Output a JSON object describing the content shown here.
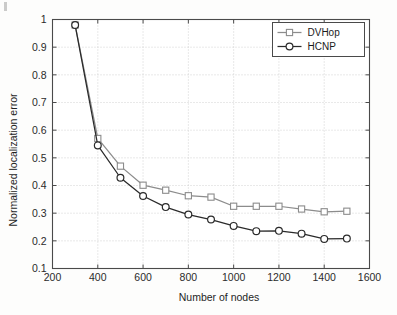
{
  "figure": {
    "background_color": "#fdfdfc",
    "plot_background_color": "#ffffff",
    "axis_color": "#4a4a4a",
    "grid_color": "#c8c8c8"
  },
  "chart_data": {
    "type": "line",
    "title": "",
    "subtitle": "",
    "xlabel": "Number of nodes",
    "ylabel": "Normalized localization error",
    "x": [
      300,
      400,
      500,
      600,
      700,
      800,
      900,
      1000,
      1100,
      1200,
      1300,
      1400,
      1500
    ],
    "xlim": [
      200,
      1600
    ],
    "ylim": [
      0.1,
      1.0
    ],
    "xticks": [
      200,
      400,
      600,
      800,
      1000,
      1200,
      1400,
      1600
    ],
    "yticks": [
      0.1,
      0.2,
      0.3,
      0.4,
      0.5,
      0.6,
      0.7,
      0.8,
      0.9,
      1
    ],
    "xtick_labels": [
      "200",
      "400",
      "600",
      "800",
      "1000",
      "1200",
      "1400",
      "1600"
    ],
    "ytick_labels": [
      "0.1",
      "0.2",
      "0.3",
      "0.4",
      "0.5",
      "0.6",
      "0.7",
      "0.8",
      "0.9",
      "1"
    ],
    "grid": true,
    "grid_style": "dotted",
    "legend_position": "top-right",
    "series": [
      {
        "name": "DVHop",
        "color": "#8c8c8c",
        "marker": "square",
        "marker_face": "#ffffff",
        "values": [
          0.98,
          0.57,
          0.47,
          0.401,
          0.383,
          0.363,
          0.358,
          0.325,
          0.325,
          0.325,
          0.315,
          0.305,
          0.307
        ]
      },
      {
        "name": "HCNP",
        "color": "#2a2a2a",
        "marker": "circle",
        "marker_face": "#ffffff",
        "values": [
          0.98,
          0.545,
          0.428,
          0.362,
          0.322,
          0.295,
          0.277,
          0.254,
          0.235,
          0.236,
          0.226,
          0.207,
          0.208
        ]
      }
    ]
  },
  "legend": {
    "items": [
      {
        "label": "DVHop"
      },
      {
        "label": "HCNP"
      }
    ]
  }
}
